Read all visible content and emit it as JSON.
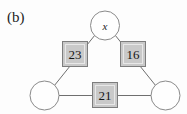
{
  "figure": {
    "panel_label": "(b)",
    "background_color": "#fdfdfd",
    "node_fill_color": "#fefefe",
    "node_stroke_color": "#8a8a8a",
    "weight_fill_color": "#c9c9c9",
    "weight_stroke_color": "#7d7d7d",
    "edge_color": "#6f6f6f"
  },
  "nodes": [
    {
      "id": "top",
      "label": "x",
      "cx": 105,
      "cy": 25,
      "r": 14.5,
      "empty": false
    },
    {
      "id": "bottom-left",
      "label": "",
      "cx": 44.5,
      "cy": 95.5,
      "r": 14.5,
      "empty": true
    },
    {
      "id": "bottom-right",
      "label": "",
      "cx": 165.5,
      "cy": 95.5,
      "r": 14.5,
      "empty": true
    }
  ],
  "edges": [
    {
      "id": "top-to-bottom-left",
      "weight": "23",
      "x1": 95,
      "y1": 35,
      "x2": 54,
      "y2": 86
    },
    {
      "id": "top-to-bottom-right",
      "weight": "16",
      "x1": 115,
      "y1": 35,
      "x2": 156,
      "y2": 86
    },
    {
      "id": "bottom-left-to-bottom-right",
      "weight": "21",
      "x1": 59,
      "y1": 95.5,
      "x2": 151,
      "y2": 95.5
    }
  ],
  "weight_boxes": [
    {
      "id": "weight-23",
      "value": "23",
      "x": 62,
      "y": 41,
      "size": 26
    },
    {
      "id": "weight-16",
      "value": "16",
      "x": 120,
      "y": 41,
      "size": 26
    },
    {
      "id": "weight-21",
      "value": "21",
      "x": 92,
      "y": 82,
      "size": 26
    }
  ]
}
